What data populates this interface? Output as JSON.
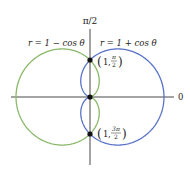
{
  "diagram": {
    "type": "polar-cardioids",
    "axis_labels": {
      "vertical": "π/2",
      "horizontal": "0"
    },
    "curves": [
      {
        "name": "r = 1 − cos θ",
        "label": "r = 1 − cos θ",
        "color": "#8ab86a"
      },
      {
        "name": "r = 1 + cos θ",
        "label": "r = 1 + cos θ",
        "color": "#5a72c8"
      }
    ],
    "points": [
      {
        "label_r": "1",
        "label_theta_num": "π",
        "label_theta_den": "2"
      },
      {
        "label_r": "1",
        "label_theta_num": "3π",
        "label_theta_den": "2"
      }
    ]
  }
}
